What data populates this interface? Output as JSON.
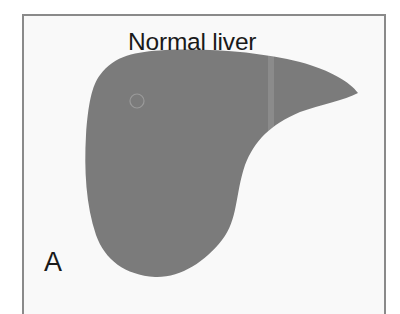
{
  "figure": {
    "title": "Normal liver",
    "panel_label": "A",
    "colors": {
      "liver_fill": "#7b7b7b",
      "frame_border": "#8a8a8a",
      "background": "#f9f9f9",
      "text": "#1a1a1a"
    },
    "marker": {
      "shape": "circle",
      "cx": 137,
      "cy": 101,
      "r": 7
    }
  }
}
